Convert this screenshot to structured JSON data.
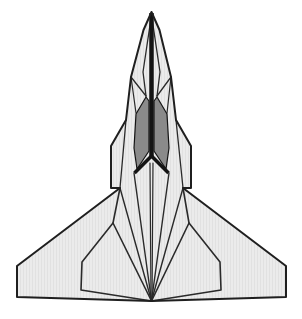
{
  "figure": {
    "description": "Top-view line drawing of a delta-wing jet fighter with paper-fold style crease lines, light gray body and dark gray cockpit panels",
    "canvas": {
      "width": 302,
      "height": 319,
      "background": "#ffffff"
    },
    "palette": {
      "body_fill": "#ebebeb",
      "body_stripe": "#e1e1e1",
      "canopy_fill": "#8a8a8a",
      "spine_black": "#141414",
      "outline": "#1f1f1f",
      "crease": "#2a2a2a"
    },
    "geometry": {
      "outline": [
        [
          151.5,
          12
        ],
        [
          159.5,
          30
        ],
        [
          171,
          77
        ],
        [
          176,
          120
        ],
        [
          191,
          146
        ],
        [
          191,
          188
        ],
        [
          183,
          188
        ],
        [
          286,
          266
        ],
        [
          286,
          297
        ],
        [
          151.5,
          301
        ],
        [
          17,
          297
        ],
        [
          17,
          266
        ],
        [
          120,
          188
        ],
        [
          111,
          188
        ],
        [
          111,
          146
        ],
        [
          126,
          120
        ],
        [
          131,
          77
        ],
        [
          143.5,
          30
        ]
      ],
      "creases": [
        {
          "name": "canopy-ridge-left",
          "w": 1.3,
          "points": [
            [
              151.5,
              15
            ],
            [
              143,
              72
            ],
            [
              146,
              96
            ]
          ]
        },
        {
          "name": "canopy-ridge-right",
          "w": 1.3,
          "points": [
            [
              151.5,
              15
            ],
            [
              160,
              72
            ],
            [
              157,
              96
            ]
          ]
        },
        {
          "name": "chevron-left",
          "w": 1.3,
          "points": [
            [
              131,
              77
            ],
            [
              146,
              96
            ]
          ]
        },
        {
          "name": "chevron-right",
          "w": 1.3,
          "points": [
            [
              171,
              77
            ],
            [
              157,
              96
            ]
          ]
        },
        {
          "name": "strake-crease-left",
          "w": 1.2,
          "points": [
            [
              131,
              77
            ],
            [
              136,
              113
            ]
          ]
        },
        {
          "name": "strake-crease-right",
          "w": 1.2,
          "points": [
            [
              171,
              77
            ],
            [
              167,
              113
            ]
          ]
        },
        {
          "name": "fuselage-crease-left",
          "w": 1.3,
          "points": [
            [
              126,
              120
            ],
            [
              120,
              188
            ]
          ]
        },
        {
          "name": "fuselage-crease-right",
          "w": 1.3,
          "points": [
            [
              176,
              120
            ],
            [
              183,
              188
            ]
          ]
        },
        {
          "name": "wing-fold-left",
          "w": 1.4,
          "points": [
            [
              120,
              188
            ],
            [
              151.5,
              301
            ]
          ]
        },
        {
          "name": "wing-fold-right",
          "w": 1.4,
          "points": [
            [
              183,
              188
            ],
            [
              151.5,
              301
            ]
          ]
        },
        {
          "name": "tail-fold-left",
          "w": 1.4,
          "points": [
            [
              134,
              173
            ],
            [
              151.5,
              301
            ]
          ]
        },
        {
          "name": "tail-fold-right",
          "w": 1.4,
          "points": [
            [
              169,
              173
            ],
            [
              151.5,
              301
            ]
          ]
        },
        {
          "name": "center-keel-left",
          "w": 1.2,
          "points": [
            [
              150,
              163
            ],
            [
              151,
              301
            ]
          ]
        },
        {
          "name": "center-keel-right",
          "w": 1.2,
          "points": [
            [
              153,
              163
            ],
            [
              152,
              301
            ]
          ]
        },
        {
          "name": "flap-outline-left",
          "w": 1.6,
          "points": [
            [
              120,
              188
            ],
            [
              113,
              223
            ],
            [
              82,
              262
            ],
            [
              81,
              290
            ],
            [
              151.5,
              301
            ]
          ]
        },
        {
          "name": "flap-inner-edge-left",
          "w": 1.6,
          "points": [
            [
              113,
              223
            ],
            [
              151.5,
              301
            ]
          ]
        },
        {
          "name": "flap-outline-right",
          "w": 1.6,
          "points": [
            [
              183,
              188
            ],
            [
              189,
              223
            ],
            [
              220,
              262
            ],
            [
              221,
              290
            ],
            [
              151.5,
              301
            ]
          ]
        },
        {
          "name": "flap-inner-edge-right",
          "w": 1.6,
          "points": [
            [
              189,
              223
            ],
            [
              151.5,
              301
            ]
          ]
        }
      ],
      "canopy_panels": [
        {
          "name": "canopy-panel-left",
          "points": [
            [
              146,
              97
            ],
            [
              136,
              114
            ],
            [
              134,
              148
            ],
            [
              137,
              169
            ],
            [
              149,
              151
            ],
            [
              149,
              101
            ]
          ]
        },
        {
          "name": "canopy-panel-right",
          "points": [
            [
              157,
              97
            ],
            [
              167,
              114
            ],
            [
              169,
              148
            ],
            [
              166,
              169
            ],
            [
              154,
              151
            ],
            [
              154,
              101
            ]
          ]
        }
      ],
      "spine": [
        {
          "name": "nose-spine",
          "w": 4.5,
          "points": [
            [
              151.5,
              13
            ],
            [
              151.5,
              157
            ]
          ]
        },
        {
          "name": "spine-leg-left",
          "w": 3.5,
          "points": [
            [
              151.5,
              156
            ],
            [
              134.5,
              173
            ]
          ]
        },
        {
          "name": "spine-leg-right",
          "w": 3.5,
          "points": [
            [
              151.5,
              156
            ],
            [
              168.5,
              173
            ]
          ]
        }
      ]
    }
  }
}
